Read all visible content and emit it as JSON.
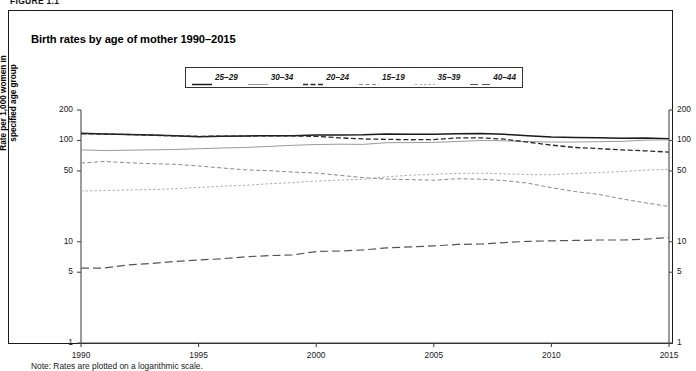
{
  "figure": {
    "number": "FIGURE 1.1",
    "title": "Birth rates by age of mother 1990–2015",
    "note": "Note: Rates are plotted on a logarithmic scale."
  },
  "axes": {
    "ylabel": "Rate per 1,000 women in specified age group",
    "xlabel": "",
    "yticks": [
      "200",
      "100",
      "50",
      "10",
      "5",
      "1"
    ],
    "xticks": [
      "1990",
      "1995",
      "2000",
      "2005",
      "2010",
      "2015"
    ]
  },
  "legend": {
    "position": "top-center",
    "items": [
      {
        "label": "25–29",
        "style": "solid",
        "color": "#1a1a1a"
      },
      {
        "label": "30–34",
        "style": "solid-light",
        "color": "#9a9a9a"
      },
      {
        "label": "20–24",
        "style": "dashdot",
        "color": "#2a2a2a"
      },
      {
        "label": "15–19",
        "style": "dashed-mid",
        "color": "#8a8a8a"
      },
      {
        "label": "35–39",
        "style": "dotted",
        "color": "#b0b0b0"
      },
      {
        "label": "40–44",
        "style": "longdash",
        "color": "#555555"
      }
    ]
  },
  "chart_data": {
    "type": "line",
    "title": "Birth rates by age of mother 1990–2015",
    "xlabel": "",
    "ylabel": "Rate per 1,000 women in specified age group",
    "xlim": [
      1990,
      2015
    ],
    "ylim": [
      1,
      200
    ],
    "yscale": "log",
    "grid": false,
    "legend_position": "top-center",
    "x": [
      1990,
      1991,
      1992,
      1993,
      1994,
      1995,
      1996,
      1997,
      1998,
      1999,
      2000,
      2001,
      2002,
      2003,
      2004,
      2005,
      2006,
      2007,
      2008,
      2009,
      2010,
      2011,
      2012,
      2013,
      2014,
      2015
    ],
    "series": [
      {
        "name": "25–29",
        "values": [
          118.2,
          115.7,
          114.6,
          113.2,
          111.1,
          108.8,
          110.4,
          111.0,
          111.2,
          111.2,
          113.5,
          113.4,
          113.6,
          115.6,
          115.5,
          115.5,
          116.8,
          117.5,
          115.1,
          111.5,
          108.3,
          107.2,
          106.5,
          105.5,
          105.8,
          104.3
        ],
        "style": "solid",
        "color": "#1a1a1a"
      },
      {
        "name": "30–34",
        "values": [
          80.8,
          79.5,
          80.2,
          80.8,
          81.5,
          82.9,
          84.3,
          85.3,
          87.4,
          89.6,
          91.2,
          91.9,
          91.5,
          95.1,
          95.3,
          95.8,
          97.7,
          99.9,
          99.3,
          97.5,
          96.5,
          96.5,
          97.3,
          98.0,
          100.8,
          101.5
        ],
        "style": "solid-light",
        "color": "#9a9a9a"
      },
      {
        "name": "20–24",
        "values": [
          116.5,
          115.7,
          114.6,
          112.6,
          111.1,
          109.8,
          110.4,
          110.4,
          111.2,
          111.0,
          109.7,
          106.2,
          103.6,
          102.6,
          101.7,
          102.2,
          105.9,
          106.3,
          103.0,
          96.3,
          90.0,
          85.3,
          83.1,
          80.7,
          79.0,
          76.8
        ],
        "style": "dashdot",
        "color": "#2a2a2a"
      },
      {
        "name": "15–19",
        "values": [
          59.9,
          62.1,
          60.3,
          59.0,
          58.2,
          56.0,
          53.5,
          51.3,
          50.3,
          48.8,
          47.7,
          45.3,
          43.0,
          41.6,
          41.1,
          40.5,
          41.9,
          41.5,
          40.2,
          37.9,
          34.2,
          31.3,
          29.4,
          26.5,
          24.2,
          22.3
        ],
        "style": "dashed-mid",
        "color": "#8a8a8a"
      },
      {
        "name": "35–39",
        "values": [
          31.7,
          32.0,
          32.5,
          32.7,
          33.4,
          34.3,
          35.4,
          36.1,
          37.4,
          38.3,
          39.7,
          40.6,
          41.4,
          43.8,
          45.4,
          46.3,
          47.3,
          47.5,
          46.9,
          46.1,
          45.9,
          47.2,
          48.3,
          49.3,
          51.0,
          51.8
        ],
        "style": "dotted",
        "color": "#b0b0b0"
      },
      {
        "name": "40–44",
        "values": [
          5.5,
          5.5,
          5.9,
          6.1,
          6.4,
          6.6,
          6.8,
          7.1,
          7.3,
          7.4,
          8.0,
          8.1,
          8.3,
          8.7,
          8.9,
          9.1,
          9.4,
          9.5,
          9.8,
          10.1,
          10.2,
          10.3,
          10.4,
          10.4,
          10.6,
          11.0
        ],
        "style": "longdash",
        "color": "#555555"
      }
    ]
  }
}
